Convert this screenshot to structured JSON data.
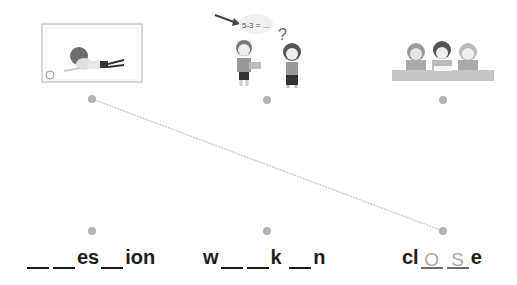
{
  "pictures": [
    {
      "name": "goalkeeper-boy",
      "desc": "boy diving in front of goal net with ball"
    },
    {
      "name": "kids-math-question",
      "desc": "boy with book, girl with question mark, speech bubble",
      "bubble_text": "5-3 = ..."
    },
    {
      "name": "kids-studying-table",
      "desc": "three kids at table with books"
    }
  ],
  "words": [
    {
      "parts": [
        {
          "blank": ""
        },
        {
          "blank": ""
        },
        {
          "text": "es"
        },
        {
          "blank": ""
        },
        {
          "text": "ion"
        }
      ]
    },
    {
      "parts": [
        {
          "text": "w"
        },
        {
          "blank": ""
        },
        {
          "blank": ""
        },
        {
          "text": "k "
        },
        {
          "blank": ""
        },
        {
          "text": "n"
        }
      ]
    },
    {
      "parts": [
        {
          "text": "cl"
        },
        {
          "blank": "O"
        },
        {
          "blank": "S"
        },
        {
          "text": "e"
        }
      ]
    }
  ],
  "connections": [
    {
      "from_picture": 0,
      "to_word": 2
    }
  ],
  "colors": {
    "dot": "#b3b3b3",
    "line": "#cccccc",
    "text": "#1d1d1d",
    "answer": "#a9a9a9"
  }
}
